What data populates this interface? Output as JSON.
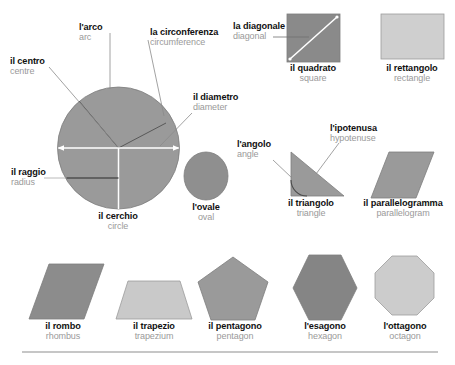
{
  "page": {
    "language_primary": "Italian",
    "language_secondary": "English",
    "background": "#ffffff",
    "primary_text_color": "#111111",
    "secondary_text_color": "#9a9a9a",
    "rule_color": "#8d8d8d"
  },
  "palette": {
    "mid_gray": "#9a9a9a",
    "dark_gray": "#8a8a8a",
    "darker_gray": "#848484",
    "light_gray": "#c9c9c9",
    "lighter_gray": "#cfcfcf",
    "shape_outline": "#7d7d7d",
    "leader_line": "#8a8a8a",
    "white_marker": "#ffffff",
    "dark_marker": "#5a5a5a"
  },
  "circle_diagram": {
    "shape_name": "circle",
    "main_label": {
      "it": "il cerchio",
      "en": "circle"
    },
    "parts": [
      {
        "id": "arc",
        "it": "l'arco",
        "en": "arc"
      },
      {
        "id": "circumference",
        "it": "la circonferenza",
        "en": "circumference"
      },
      {
        "id": "centre",
        "it": "il centro",
        "en": "centre"
      },
      {
        "id": "diameter",
        "it": "il diametro",
        "en": "diameter"
      },
      {
        "id": "radius",
        "it": "il raggio",
        "en": "radius"
      }
    ]
  },
  "shapes_top": [
    {
      "id": "square",
      "it": "il quadrato",
      "en": "square",
      "fill": "#8a8a8a",
      "part": {
        "id": "diagonal",
        "it": "la diagonale",
        "en": "diagonal"
      }
    },
    {
      "id": "rectangle",
      "it": "il rettangolo",
      "en": "rectangle",
      "fill": "#cfcfcf"
    }
  ],
  "shapes_middle": [
    {
      "id": "oval",
      "it": "l'ovale",
      "en": "oval",
      "fill": "#8f8f8f"
    },
    {
      "id": "triangle",
      "it": "il triangolo",
      "en": "triangle",
      "fill": "#9a9a9a",
      "parts": [
        {
          "id": "angle",
          "it": "l'angolo",
          "en": "angle"
        },
        {
          "id": "hypotenuse",
          "it": "l'ipotenusa",
          "en": "hypotenuse"
        }
      ]
    },
    {
      "id": "parallelogram",
      "it": "il parallelogramma",
      "en": "parallelogram",
      "fill": "#9a9a9a"
    }
  ],
  "shapes_bottom": [
    {
      "id": "rhombus",
      "it": "il rombo",
      "en": "rhombus",
      "fill": "#8c8c8c"
    },
    {
      "id": "trapezium",
      "it": "il trapezio",
      "en": "trapezium",
      "fill": "#c9c9c9"
    },
    {
      "id": "pentagon",
      "it": "il pentagono",
      "en": "pentagon",
      "fill": "#9a9a9a"
    },
    {
      "id": "hexagon",
      "it": "l'esagono",
      "en": "hexagon",
      "fill": "#858585"
    },
    {
      "id": "octagon",
      "it": "l'ottagono",
      "en": "octagon",
      "fill": "#cccccc"
    }
  ]
}
